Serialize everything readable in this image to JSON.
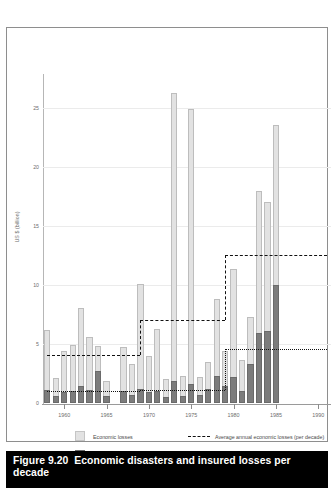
{
  "figure": {
    "caption_number": "Figure 9.20",
    "caption_text": "Economic disasters and insured losses per decade"
  },
  "legend": {
    "economic_label": "Economic losses",
    "insured_label": "Insured losses",
    "avg_economic_label": "Average annual economic losses (per decade)",
    "avg_insured_label": "Average annual insured losses (per decade)"
  },
  "colors": {
    "economic": "#e2e2e2",
    "insured": "#7c7c7c",
    "caption_bg": "#000000",
    "axis": "#9a9a9a",
    "grid": "#ebebeb"
  },
  "chart_data": {
    "type": "bar",
    "title": "Economic disasters and insured losses per decade",
    "xlabel": "",
    "ylabel": "US $ (billion)",
    "ylim": [
      0,
      27.5
    ],
    "xlim": [
      1957.5,
      1991.5
    ],
    "grid": true,
    "legend_position": "bottom",
    "stacked": true,
    "yticks": [
      0,
      5,
      10,
      15,
      20,
      25
    ],
    "ytick_labels": [
      "0",
      "5",
      "10",
      "15",
      "20",
      "25"
    ],
    "xticks": [
      1960,
      1965,
      1970,
      1975,
      1980,
      1985,
      1990
    ],
    "xtick_labels": [
      "1960",
      "1965",
      "1970",
      "1975",
      "1980",
      "1985",
      "1990"
    ],
    "x": [
      1958,
      1959,
      1960,
      1961,
      1962,
      1963,
      1964,
      1965,
      1966,
      1967,
      1968,
      1969,
      1970,
      1971,
      1972,
      1973,
      1974,
      1975,
      1976,
      1977,
      1978,
      1979,
      1980,
      1981,
      1982,
      1983,
      1984,
      1985,
      1986,
      1987,
      1988,
      1989,
      1990
    ],
    "series": [
      {
        "name": "Economic losses",
        "color": "#e2e2e2",
        "values": [
          6.2,
          2.1,
          4.4,
          4.9,
          8.0,
          5.6,
          4.8,
          1.9,
          0.0,
          4.7,
          3.3,
          10.1,
          4.0,
          6.3,
          2.0,
          26.2,
          2.3,
          24.9,
          2.2,
          3.5,
          8.8,
          4.4,
          11.3,
          3.6,
          7.3,
          17.9,
          17.0,
          23.5,
          0.0,
          0.0,
          0.0,
          0.0,
          0.0
        ]
      },
      {
        "name": "Insured losses",
        "color": "#7c7c7c",
        "values": [
          1.1,
          0.6,
          0.9,
          1.0,
          1.4,
          1.1,
          2.7,
          0.6,
          0.0,
          1.0,
          0.7,
          1.2,
          0.9,
          1.0,
          0.5,
          1.9,
          0.6,
          1.6,
          0.7,
          1.2,
          2.3,
          1.4,
          2.2,
          1.0,
          3.3,
          5.9,
          6.1,
          10.0,
          0.0,
          0.0,
          0.0,
          0.0,
          0.0
        ]
      }
    ],
    "reference_lines": [
      {
        "name": "Average annual economic losses (per decade)",
        "style": "dashed",
        "steps": [
          {
            "decade": "1960s",
            "x_start": 1958,
            "x_end": 1969,
            "value": 4.1
          },
          {
            "decade": "1970s",
            "x_start": 1969,
            "x_end": 1979,
            "value": 7.0
          },
          {
            "decade": "1980s",
            "x_start": 1979,
            "x_end": 1991,
            "value": 12.5
          }
        ]
      },
      {
        "name": "Average annual insured losses (per decade)",
        "style": "dotted",
        "steps": [
          {
            "decade": "1960s",
            "x_start": 1958,
            "x_end": 1969,
            "value": 1.0
          },
          {
            "decade": "1970s",
            "x_start": 1969,
            "x_end": 1979,
            "value": 1.1
          },
          {
            "decade": "1980s",
            "x_start": 1979,
            "x_end": 1991,
            "value": 4.6
          }
        ]
      }
    ]
  }
}
